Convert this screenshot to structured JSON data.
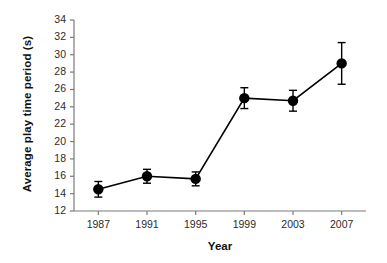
{
  "chart_data": {
    "type": "line",
    "title": "",
    "xlabel": "Year",
    "ylabel": "Average play time period (s)",
    "categories": [
      "1987",
      "1991",
      "1995",
      "1999",
      "2003",
      "2007"
    ],
    "values": [
      14.5,
      16.0,
      15.7,
      25.0,
      24.7,
      29.0
    ],
    "errors": [
      0.9,
      0.8,
      0.8,
      1.2,
      1.2,
      2.4
    ],
    "error_type": "symmetric",
    "ylim": [
      12,
      34
    ],
    "ytick_step": 2,
    "yticks": [
      "34",
      "32",
      "30",
      "28",
      "26",
      "24",
      "22",
      "20",
      "18",
      "16",
      "14",
      "12"
    ],
    "grid": false,
    "legend": "none",
    "marker": "filled-circle",
    "marker_color": "#000000",
    "line_color": "#000000",
    "axis_color": "#7a7a7a",
    "background": "#ffffff"
  }
}
